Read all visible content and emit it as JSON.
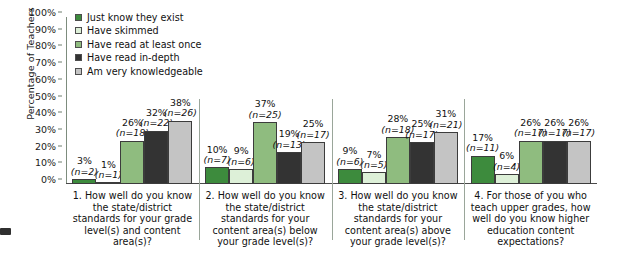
{
  "chart_data": {
    "type": "bar",
    "title": "",
    "xlabel": "",
    "ylabel": "Percentage of Teachers",
    "ylim": [
      0,
      100
    ],
    "ytick_labels": [
      "100%",
      "90%",
      "80%",
      "70%",
      "60%",
      "50%",
      "40%",
      "30%",
      "20%",
      "10%",
      "0%"
    ],
    "ytick_values": [
      100,
      90,
      80,
      70,
      60,
      50,
      40,
      30,
      20,
      10,
      0
    ],
    "grid": false,
    "legend_position": "upper-left-inside",
    "legend": [
      {
        "label": "Just know they exist",
        "color": "#3d8b3d"
      },
      {
        "label": "Have skimmed",
        "color": "#ddf0d8"
      },
      {
        "label": "Have read at least once",
        "color": "#8fbc7f"
      },
      {
        "label": "Have read in-depth",
        "color": "#333333"
      },
      {
        "label": "Am very knowledgeable",
        "color": "#c4c4c4"
      }
    ],
    "categories": [
      "1. How well do you know the state/district standards for your grade level(s) and content area(s)?",
      "2. How well do you know the state/district standards for your content area(s) below your grade level(s)?",
      "3. How well do you know the state/district standards for your content area(s) above your grade level(s)?",
      "4. For those of you who teach upper grades, how well do you know higher education content expectations?"
    ],
    "series": [
      {
        "name": "Just know they exist",
        "color": "#3d8b3d",
        "values": [
          3,
          10,
          9,
          17
        ],
        "counts": [
          2,
          7,
          6,
          11
        ]
      },
      {
        "name": "Have skimmed",
        "color": "#ddf0d8",
        "values": [
          1,
          9,
          7,
          6
        ],
        "counts": [
          1,
          6,
          5,
          4
        ]
      },
      {
        "name": "Have read at least once",
        "color": "#8fbc7f",
        "values": [
          26,
          37,
          28,
          26
        ],
        "counts": [
          18,
          25,
          18,
          17
        ]
      },
      {
        "name": "Have read in-depth",
        "color": "#333333",
        "values": [
          32,
          19,
          25,
          26
        ],
        "counts": [
          22,
          13,
          17,
          17
        ]
      },
      {
        "name": "Am very knowledgeable",
        "color": "#c4c4c4",
        "values": [
          38,
          25,
          31,
          26
        ],
        "counts": [
          26,
          17,
          21,
          17
        ]
      }
    ],
    "bar_labels": [
      [
        {
          "pct": "3%",
          "n": "(n=2)"
        },
        {
          "pct": "1%",
          "n": "(n=1)"
        },
        {
          "pct": "26%",
          "n": "(n=18)"
        },
        {
          "pct": "32%",
          "n": "(n=22)"
        },
        {
          "pct": "38%",
          "n": "(n=26)"
        }
      ],
      [
        {
          "pct": "10%",
          "n": "(n=7)"
        },
        {
          "pct": "9%",
          "n": "(n=6)"
        },
        {
          "pct": "37%",
          "n": "(n=25)"
        },
        {
          "pct": "19%",
          "n": "(n=13)"
        },
        {
          "pct": "25%",
          "n": "(n=17)"
        }
      ],
      [
        {
          "pct": "9%",
          "n": "(n=6)"
        },
        {
          "pct": "7%",
          "n": "(n=5)"
        },
        {
          "pct": "28%",
          "n": "(n=18)"
        },
        {
          "pct": "25%",
          "n": "(n=17)"
        },
        {
          "pct": "31%",
          "n": "(n=21)"
        }
      ],
      [
        {
          "pct": "17%",
          "n": "(n=11)"
        },
        {
          "pct": "6%",
          "n": "(n=4)"
        },
        {
          "pct": "26%",
          "n": "(n=17)"
        },
        {
          "pct": "26%",
          "n": "(n=17)"
        },
        {
          "pct": "26%",
          "n": "(n=17)"
        }
      ]
    ]
  }
}
